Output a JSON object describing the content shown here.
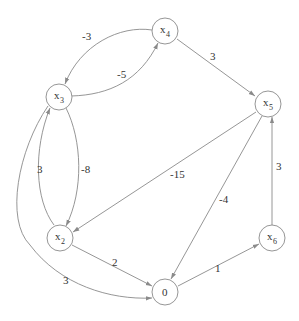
{
  "diagram": {
    "type": "directed weighted graph",
    "nodes": [
      {
        "id": "x3",
        "label": "x",
        "sub": "3"
      },
      {
        "id": "x4",
        "label": "x",
        "sub": "4"
      },
      {
        "id": "x5",
        "label": "x",
        "sub": "5"
      },
      {
        "id": "x2",
        "label": "x",
        "sub": "2"
      },
      {
        "id": "0",
        "label": "0",
        "sub": ""
      },
      {
        "id": "x6",
        "label": "x",
        "sub": "6"
      }
    ],
    "edges": [
      {
        "from": "x4",
        "to": "x3",
        "weight": "-3"
      },
      {
        "from": "x3",
        "to": "x4",
        "weight": "-5"
      },
      {
        "from": "x4",
        "to": "x5",
        "weight": "3"
      },
      {
        "from": "x2",
        "to": "x3",
        "weight": "3"
      },
      {
        "from": "x3",
        "to": "x2",
        "weight": "-8"
      },
      {
        "from": "x5",
        "to": "x2",
        "weight": "-15"
      },
      {
        "from": "x5",
        "to": "0",
        "weight": "-4"
      },
      {
        "from": "x6",
        "to": "x5",
        "weight": "3"
      },
      {
        "from": "x3",
        "to": "0",
        "weight": "3"
      },
      {
        "from": "x2",
        "to": "0",
        "weight": "2"
      },
      {
        "from": "0",
        "to": "x6",
        "weight": "1"
      }
    ]
  },
  "colors": {
    "edge": "#8a8a8a",
    "text": "#333333",
    "background": "#ffffff"
  }
}
